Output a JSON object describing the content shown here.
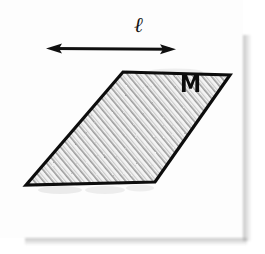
{
  "figure": {
    "kind": "hand-drawn-geometry-diagram",
    "caption_labels": {
      "length_label": "ℓ",
      "region_label": "M"
    },
    "background_color": "#ffffff",
    "card_color": "#fdfdfd",
    "ink_color": "#101010",
    "hatch_color": "#9a9a9a",
    "shadow_color": "#9b9b9b"
  },
  "shapes": {
    "parallelogram": {
      "name": "hatched-parallelogram",
      "fill": "#f2f2f2",
      "stroke": "#101010",
      "stroke_width": 3,
      "hatch_pattern": "diagonal-lines",
      "vertices": [
        {
          "x": 123,
          "y": 72
        },
        {
          "x": 230,
          "y": 75
        },
        {
          "x": 155,
          "y": 182
        },
        {
          "x": 26,
          "y": 185
        }
      ]
    },
    "dimension_arrow": {
      "name": "length-dimension-arrow",
      "stroke": "#101010",
      "stroke_width": 3,
      "double_headed": true,
      "start": {
        "x": 47,
        "y": 48
      },
      "end": {
        "x": 175,
        "y": 49
      }
    }
  }
}
